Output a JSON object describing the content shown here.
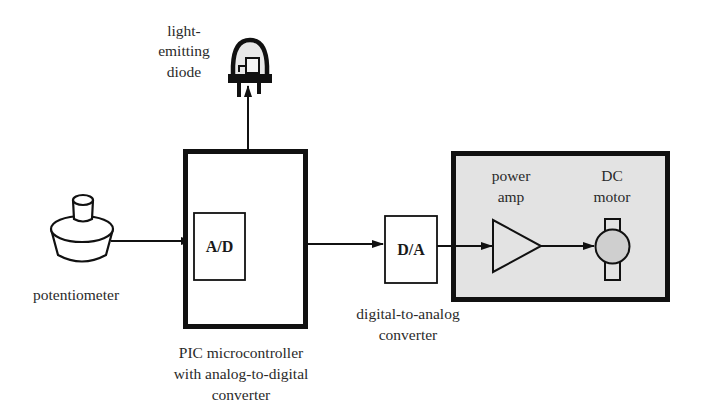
{
  "diagram": {
    "type": "block-diagram",
    "title": "",
    "colors": {
      "stroke": "#111111",
      "background": "#ffffff",
      "shaded_region": "#e3e3e3",
      "motor_fill": "#cfcfcf"
    },
    "nodes": {
      "led": {
        "label_lines": [
          "light-",
          "emitting",
          "diode"
        ],
        "icon": "led-icon"
      },
      "potentiometer": {
        "label": "potentiometer",
        "icon": "potentiometer-icon"
      },
      "pic": {
        "label_lines": [
          "PIC microcontroller",
          "with analog-to-digital",
          "converter"
        ],
        "inner_block": {
          "label": "A/D"
        }
      },
      "dac": {
        "block_label": "D/A",
        "label_lines": [
          "digital-to-analog",
          "converter"
        ]
      },
      "power_amp": {
        "label_lines": [
          "power",
          "amp"
        ],
        "icon": "amplifier-triangle-icon"
      },
      "dc_motor": {
        "label_lines": [
          "DC",
          "motor"
        ],
        "icon": "dc-motor-icon"
      }
    },
    "edges": [
      {
        "from": "potentiometer",
        "to": "A/D"
      },
      {
        "from": "PIC microcontroller",
        "to": "light-emitting diode"
      },
      {
        "from": "PIC microcontroller",
        "to": "D/A"
      },
      {
        "from": "D/A",
        "to": "power amp"
      },
      {
        "from": "power amp",
        "to": "DC motor"
      }
    ],
    "groups": [
      {
        "name": "shaded-output-stage",
        "contains": [
          "power amp",
          "DC motor"
        ]
      }
    ]
  }
}
